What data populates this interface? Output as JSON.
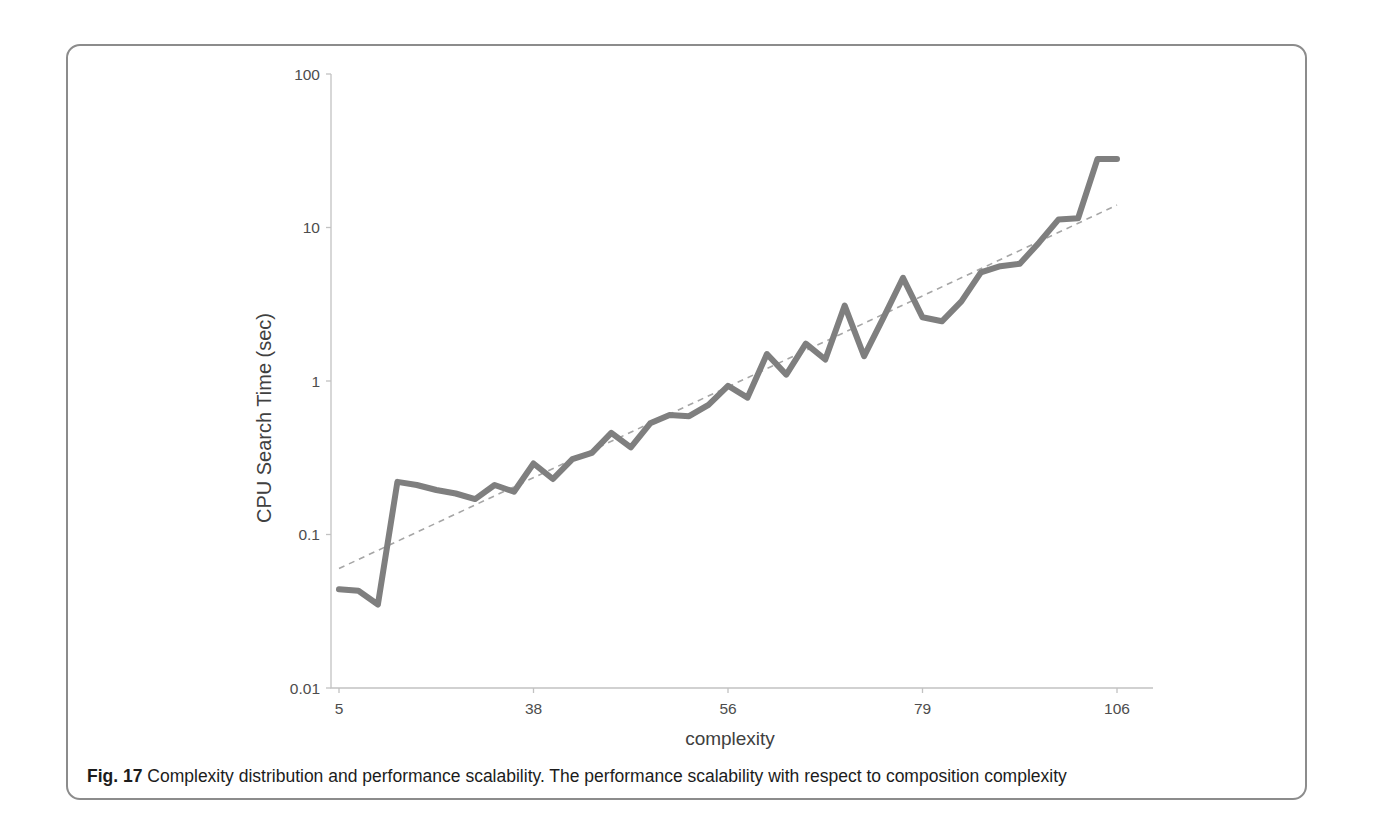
{
  "chart_data": {
    "type": "line",
    "title": "",
    "xlabel": "complexity",
    "ylabel": "CPU Search Time (sec)",
    "y_scale": "log10",
    "ylim": [
      0.01,
      100
    ],
    "y_tick_labels": [
      "100",
      "10",
      "1",
      "0.1",
      "0.01"
    ],
    "y_tick_values": [
      100,
      10,
      1,
      0.1,
      0.01
    ],
    "x_tick_labels": [
      "5",
      "38",
      "56",
      "79",
      "106"
    ],
    "x_tick_point_indices": [
      0,
      10,
      20,
      30,
      40
    ],
    "grid": false,
    "legend": false,
    "series": [
      {
        "name": "CPU search time",
        "color": "#7f7f7f",
        "stroke_width": 6,
        "values": [
          0.044,
          0.043,
          0.035,
          0.22,
          0.21,
          0.195,
          0.185,
          0.17,
          0.21,
          0.19,
          0.29,
          0.23,
          0.31,
          0.34,
          0.46,
          0.37,
          0.53,
          0.6,
          0.59,
          0.7,
          0.93,
          0.78,
          1.5,
          1.1,
          1.75,
          1.38,
          3.1,
          1.45,
          2.6,
          4.7,
          2.6,
          2.45,
          3.3,
          5.1,
          5.6,
          5.8,
          8.0,
          11.3,
          11.5,
          28,
          28
        ]
      }
    ],
    "trendline": {
      "style": "dashed",
      "color": "#a6a6a6",
      "start_value": 0.06,
      "end_value": 14
    }
  },
  "caption": {
    "label": "Fig. 17",
    "text": "Complexity distribution and performance scalability. The performance scalability with respect to composition complexity"
  },
  "colors": {
    "axis": "#c2c2c2",
    "tick_label": "#4d4d4d",
    "axis_title": "#404040",
    "panel_border": "#8c8c8c"
  }
}
